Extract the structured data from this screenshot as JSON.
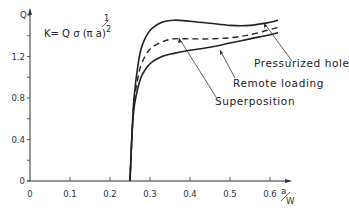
{
  "chart_data": {
    "type": "line",
    "title": "",
    "formula": {
      "main": "K= Q σ (π a)",
      "exponent_num": "1",
      "exponent_den": "2"
    },
    "xlabel": {
      "num": "a",
      "den": "W"
    },
    "ylabel": "Q",
    "xlim": [
      0,
      0.65
    ],
    "ylim": [
      0,
      1.6
    ],
    "x_ticks": [
      "0",
      "0.1",
      "0.2",
      "0.3",
      "0.4",
      "0.5",
      "0.6"
    ],
    "y_ticks": [
      "0",
      "0.4",
      "0.8",
      "1.2"
    ],
    "grid": false,
    "legend_position": "inline annotations with leader lines",
    "series": [
      {
        "name": "Pressurized hole",
        "style": "solid",
        "x": [
          0.25,
          0.255,
          0.26,
          0.27,
          0.28,
          0.3,
          0.33,
          0.36,
          0.4,
          0.45,
          0.5,
          0.55,
          0.6,
          0.62
        ],
        "y": [
          0,
          0.45,
          0.8,
          1.12,
          1.3,
          1.45,
          1.53,
          1.55,
          1.54,
          1.52,
          1.5,
          1.5,
          1.53,
          1.55
        ]
      },
      {
        "name": "Superposition",
        "style": "dashed",
        "x": [
          0.25,
          0.255,
          0.26,
          0.27,
          0.28,
          0.3,
          0.33,
          0.36,
          0.4,
          0.45,
          0.5,
          0.55,
          0.6,
          0.62
        ],
        "y": [
          0,
          0.45,
          0.75,
          1.0,
          1.14,
          1.27,
          1.34,
          1.37,
          1.37,
          1.37,
          1.38,
          1.41,
          1.46,
          1.48
        ]
      },
      {
        "name": "Remote loading",
        "style": "solid",
        "x": [
          0.25,
          0.255,
          0.26,
          0.27,
          0.28,
          0.3,
          0.33,
          0.36,
          0.4,
          0.45,
          0.5,
          0.55,
          0.6,
          0.62
        ],
        "y": [
          0,
          0.45,
          0.7,
          0.9,
          1.02,
          1.13,
          1.2,
          1.23,
          1.26,
          1.29,
          1.33,
          1.37,
          1.41,
          1.43
        ]
      }
    ]
  },
  "annotations": {
    "pressurized": "Pressurized hole",
    "remote": "Remote loading",
    "superposition": "Superposition"
  }
}
